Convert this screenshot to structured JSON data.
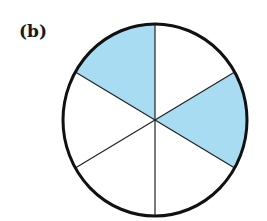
{
  "figure": {
    "label": "(b)",
    "total_sectors": 6,
    "shaded_sectors": 2,
    "colors": {
      "fill": "#a8dcf2",
      "stroke": "#111111",
      "background": "#ffffff"
    }
  }
}
